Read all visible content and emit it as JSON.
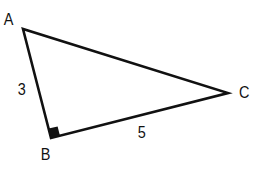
{
  "diagram": {
    "type": "right-triangle",
    "vertices": {
      "A": {
        "label": "A",
        "x": 23,
        "y": 29
      },
      "B": {
        "label": "B",
        "x": 51,
        "y": 138
      },
      "C": {
        "label": "C",
        "x": 228,
        "y": 93
      }
    },
    "right_angle_at": "B",
    "sides": {
      "AB": {
        "label": "3"
      },
      "BC": {
        "label": "5"
      }
    },
    "colors": {
      "stroke": "#111111",
      "background": "#ffffff"
    }
  }
}
